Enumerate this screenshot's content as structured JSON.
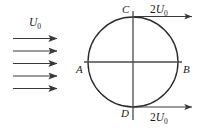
{
  "figure": {
    "name": "flow-past-cylinder-velocity-diagram",
    "background_color": "#ffffff",
    "stroke_color": "#3a3a3a",
    "text_color": "#1a1a1a"
  },
  "freestream": {
    "label_symbol": "U",
    "label_subscript": "0",
    "arrow_count": 5,
    "arrow_name": "freestream-velocity-arrow"
  },
  "circle": {
    "center_x": 133,
    "center_y": 62,
    "radius": 45,
    "name": "cylinder-circle"
  },
  "points": [
    {
      "id": "A",
      "label": "A",
      "position": "left"
    },
    {
      "id": "B",
      "label": "B",
      "position": "right"
    },
    {
      "id": "C",
      "label": "C",
      "position": "top"
    },
    {
      "id": "D",
      "label": "D",
      "position": "bottom"
    }
  ],
  "vectors": [
    {
      "id": "top",
      "coefficient": "2",
      "symbol": "U",
      "subscript": "0",
      "name": "velocity-arrow-top"
    },
    {
      "id": "bottom",
      "coefficient": "2",
      "symbol": "U",
      "subscript": "0",
      "name": "velocity-arrow-bottom"
    }
  ],
  "axes": {
    "horizontal_name": "horizontal-axis-line",
    "vertical_name": "vertical-axis-line"
  }
}
